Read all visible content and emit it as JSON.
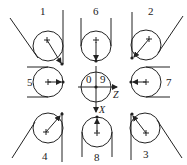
{
  "diagram": {
    "type": "roller-wrap-configurations",
    "cells": [
      {
        "id": 1,
        "label": "1",
        "position": "top-left"
      },
      {
        "id": 6,
        "label": "6",
        "position": "top-center"
      },
      {
        "id": 2,
        "label": "2",
        "position": "top-right"
      },
      {
        "id": 5,
        "label": "5",
        "position": "middle-left"
      },
      {
        "id": 0,
        "label": "0",
        "position": "center"
      },
      {
        "id": 9,
        "label": "9",
        "position": "center"
      },
      {
        "id": 7,
        "label": "7",
        "position": "middle-right"
      },
      {
        "id": 4,
        "label": "4",
        "position": "bottom-left"
      },
      {
        "id": 8,
        "label": "8",
        "position": "bottom-center"
      },
      {
        "id": 3,
        "label": "3",
        "position": "bottom-right"
      }
    ],
    "axes": {
      "z_label": "Z",
      "x_label": "X"
    },
    "colors": {
      "stroke": "#222222",
      "background": "#ffffff"
    }
  }
}
